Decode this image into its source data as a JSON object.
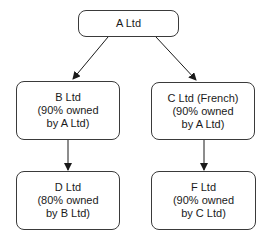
{
  "diagram": {
    "type": "organization-chart",
    "colors": {
      "border": "#3a3a3a",
      "arrow": "#1a1a1a",
      "background": "#ffffff"
    },
    "nodes": {
      "a": {
        "id": "A",
        "lines": [
          "A Ltd"
        ]
      },
      "b": {
        "id": "B",
        "lines": [
          "B Ltd",
          "(90% owned",
          "by A Ltd)"
        ]
      },
      "c": {
        "id": "C",
        "lines": [
          "C Ltd (French)",
          "(90% owned",
          "by A Ltd)"
        ]
      },
      "d": {
        "id": "D",
        "lines": [
          "D Ltd",
          "(80% owned",
          "by B Ltd)"
        ]
      },
      "f": {
        "id": "F",
        "lines": [
          "F Ltd",
          "(90% owned",
          "by C Ltd)"
        ]
      }
    },
    "edges": [
      {
        "from": "A",
        "to": "B"
      },
      {
        "from": "A",
        "to": "C"
      },
      {
        "from": "B",
        "to": "D"
      },
      {
        "from": "C",
        "to": "F"
      }
    ]
  }
}
